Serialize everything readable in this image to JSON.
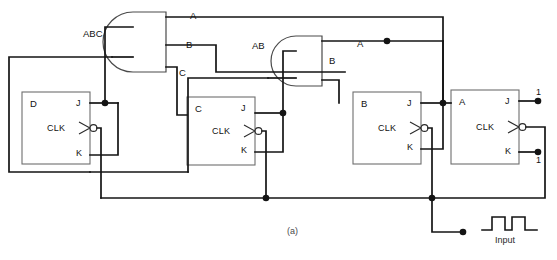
{
  "figure": {
    "caption": "(a)",
    "kind": "logic-diagram"
  },
  "colors": {
    "wire": "#141414",
    "gate_stroke": "#4a4a4a",
    "box_stroke": "#6e6e6e",
    "text": "#121212",
    "background": "#ffffff",
    "caption_text": "#4a4a4a"
  },
  "signals": {
    "abc": "ABC",
    "ab": "AB",
    "a_top": "A",
    "a_second": "A",
    "b_left": "B",
    "b_right": "B",
    "c": "C"
  },
  "flipflops": [
    {
      "name": "D",
      "j": "J",
      "clk": "CLK",
      "k": "K"
    },
    {
      "name": "C",
      "j": "J",
      "clk": "CLK",
      "k": "K"
    },
    {
      "name": "B",
      "j": "J",
      "clk": "CLK",
      "k": "K"
    },
    {
      "name": "A",
      "j": "J",
      "clk": "CLK",
      "k": "K"
    }
  ],
  "constants": {
    "j_high": "1",
    "k_high": "1"
  },
  "input_waveform": {
    "label": "Input",
    "pulses": 2,
    "levels": [
      0,
      1,
      0,
      1,
      0
    ]
  },
  "gates": [
    {
      "type": "AND",
      "inputs": 2,
      "output_signal": "ABC"
    },
    {
      "type": "AND",
      "inputs": 2,
      "output_signal": "AB"
    }
  ]
}
